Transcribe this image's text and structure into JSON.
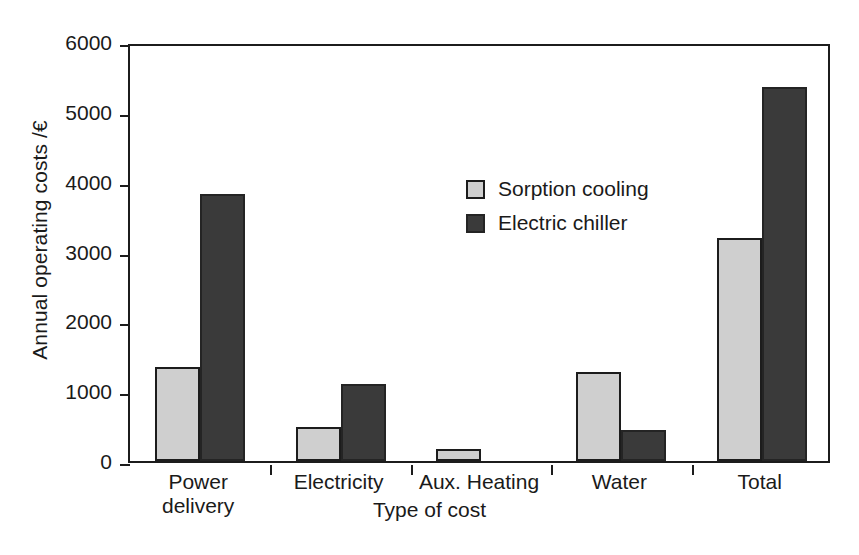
{
  "chart_data": {
    "type": "bar",
    "title": "",
    "xlabel": "Type of cost",
    "ylabel": "Annual operating costs /€",
    "categories": [
      "Power delivery",
      "Electricity",
      "Aux. Heating",
      "Water",
      "Total"
    ],
    "category_lines": [
      [
        "Power",
        "delivery"
      ],
      [
        "Electricity",
        ""
      ],
      [
        "Aux. Heating",
        ""
      ],
      [
        "Water",
        ""
      ],
      [
        "Total",
        ""
      ]
    ],
    "series": [
      {
        "name": "Sorption cooling",
        "color": "#cfcfcf",
        "values": [
          1350,
          480,
          170,
          1270,
          3200
        ]
      },
      {
        "name": "Electric chiller",
        "color": "#3a3a3a",
        "values": [
          3830,
          1100,
          0,
          450,
          5350
        ]
      }
    ],
    "ylim": [
      0,
      6000
    ],
    "yticks": [
      0,
      1000,
      2000,
      3000,
      4000,
      5000,
      6000
    ],
    "ytick_labels": [
      "0",
      "1000",
      "2000",
      "3000",
      "4000",
      "5000",
      "6000"
    ],
    "grid": false,
    "legend_position": "upper center"
  },
  "legend": {
    "items": [
      {
        "label": "Sorption cooling",
        "swatch": "light"
      },
      {
        "label": "Electric chiller",
        "swatch": "dark"
      }
    ]
  },
  "axes": {
    "y_title": "Annual operating costs /€",
    "x_title": "Type of cost"
  }
}
